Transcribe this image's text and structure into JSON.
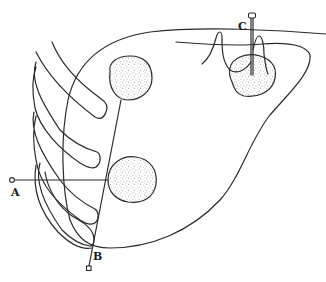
{
  "figure": {
    "labels": {
      "needle_a": "A",
      "needle_b": "B",
      "needle_c": "C"
    },
    "colors": {
      "line": "#2a2a2a",
      "background": "#ffffff",
      "stipple": "#555555"
    },
    "lesions": [
      {
        "id": "upper-left-lesion",
        "target_of": "B"
      },
      {
        "id": "lower-left-lesion",
        "target_of": "A"
      },
      {
        "id": "upper-right-lesion",
        "target_of": "C"
      }
    ],
    "rib_count": 4
  }
}
